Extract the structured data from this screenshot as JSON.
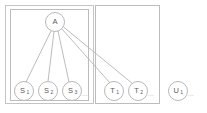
{
  "figure": {
    "title": "",
    "background_color": "#ffffff",
    "line_color": "#b4b4b4",
    "box_color": "#bcbcbc",
    "text_color": "#5a5a5a"
  },
  "nodes": {
    "root": {
      "label": "A",
      "subscript": "",
      "cx": 55,
      "cy": 22,
      "r": 9.5
    },
    "s1": {
      "label": "S",
      "subscript": "1",
      "cx": 24,
      "cy": 91,
      "r": 9.5
    },
    "s2": {
      "label": "S",
      "subscript": "2",
      "cx": 48,
      "cy": 91,
      "r": 9.5
    },
    "s3": {
      "label": "S",
      "subscript": "3",
      "cx": 72,
      "cy": 91,
      "r": 9.5
    },
    "t1": {
      "label": "T",
      "subscript": "1",
      "cx": 114,
      "cy": 91,
      "r": 9.5
    },
    "t2": {
      "label": "T",
      "subscript": "2",
      "cx": 138,
      "cy": 91,
      "r": 9.5
    },
    "u1": {
      "label": "U",
      "subscript": "1",
      "cx": 178,
      "cy": 91,
      "r": 9.5
    }
  },
  "edges": [
    {
      "from": "A",
      "to": "S1"
    },
    {
      "from": "A",
      "to": "S2"
    },
    {
      "from": "A",
      "to": "S3"
    },
    {
      "from": "A",
      "to": "T1"
    },
    {
      "from": "A",
      "to": "T2"
    }
  ],
  "boxes": {
    "outer": {
      "x": 5,
      "y": 5,
      "width": 89,
      "height": 99
    },
    "inner": {
      "x": 10,
      "y": 9,
      "width": 79,
      "height": 92
    },
    "middle": {
      "x": 95,
      "y": 5,
      "width": 65,
      "height": 99
    }
  },
  "ellipses": {
    "after_s3": "...",
    "after_t2": "...",
    "after_u1": "..."
  }
}
